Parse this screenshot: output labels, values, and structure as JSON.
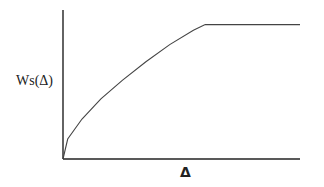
{
  "chart_data": {
    "type": "line",
    "title": "",
    "xlabel": "Δ",
    "ylabel": "Ws(Δ)",
    "grid": false,
    "legend": null,
    "ticks": {
      "x": [],
      "y": []
    },
    "xlim": [
      0,
      1
    ],
    "ylim": [
      0,
      1
    ],
    "series": [
      {
        "name": "Ws(Δ)",
        "x": [
          0,
          0.02,
          0.08,
          0.16,
          0.25,
          0.35,
          0.45,
          0.55,
          0.6,
          1.0
        ],
        "y": [
          0,
          0.14,
          0.28,
          0.42,
          0.55,
          0.68,
          0.8,
          0.9,
          0.94,
          0.94
        ]
      }
    ],
    "annotations": [
      "Curve rises concavely from origin and saturates to a flat plateau at about 60% of the x range"
    ]
  },
  "labels": {
    "y_axis": "Ws(Δ)",
    "x_axis": "Δ"
  }
}
